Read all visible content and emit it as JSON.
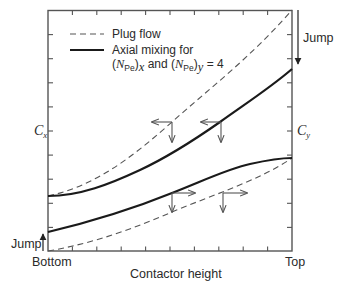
{
  "legend": {
    "plug_flow_label": "Plug flow",
    "axial_line1": "Axial mixing for",
    "axial_line2_pre": "(",
    "axial_N": "N",
    "axial_sub": "Pe",
    "axial_close_x": ")",
    "axial_sub_x": "x",
    "axial_and": " and (",
    "axial_sub_y": "y",
    "axial_value": " = 4"
  },
  "axes": {
    "left_label": "C",
    "left_sub": "x",
    "right_label": "C",
    "right_sub": "y",
    "x_left": "Bottom",
    "x_right": "Top",
    "x_title": "Contactor height"
  },
  "annotations": {
    "jump_top": "Jump",
    "jump_bottom": "Jump"
  },
  "colors": {
    "line": "#1a1a1a",
    "dash": "#555555",
    "arrow": "#666666",
    "frame": "#555555"
  }
}
